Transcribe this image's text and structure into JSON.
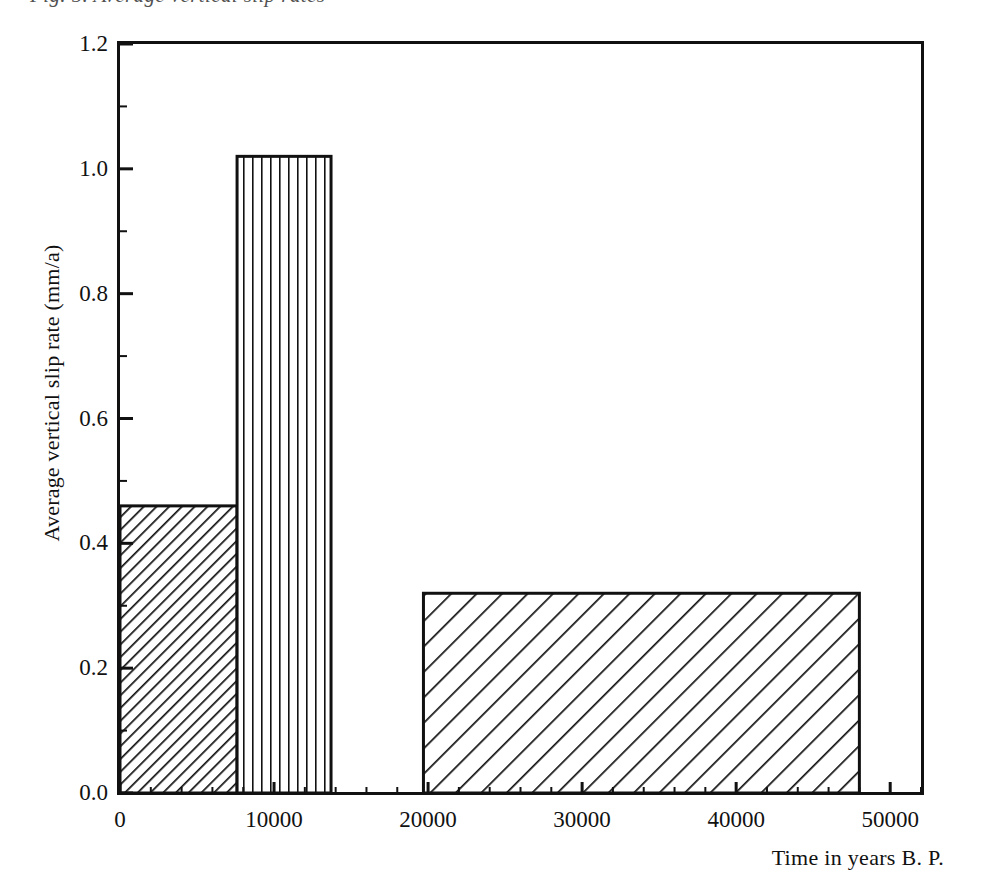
{
  "figure": {
    "background_color": "#ffffff",
    "ink_color": "#111111",
    "top_cropped_caption": "Fig. 5. Average vertical slip rates"
  },
  "chart_data": {
    "type": "bar",
    "title": "",
    "subtitle": "",
    "xlabel": "Time in years B. P.",
    "ylabel": "Average vertical slip rate (mm/a)",
    "xlim": [
      0,
      52000
    ],
    "ylim": [
      0.0,
      1.2
    ],
    "grid": false,
    "legend": null,
    "x_major_ticks": [
      0,
      10000,
      20000,
      30000,
      40000,
      50000
    ],
    "x_tick_labels": [
      "0",
      "10000",
      "20000",
      "30000",
      "40000",
      "50000"
    ],
    "x_minor_tick_step": 2000,
    "y_major_ticks": [
      0.0,
      0.2,
      0.4,
      0.6,
      0.8,
      1.0,
      1.2
    ],
    "y_tick_labels": [
      "0.0",
      "0.2",
      "0.4",
      "0.6",
      "0.8",
      "1.0",
      "1.2"
    ],
    "y_minor_tick_step": 0.1,
    "categories": [
      "0 - 7600",
      "7600 - 13700",
      "19700 - 48000"
    ],
    "values": [
      0.46,
      1.02,
      0.32
    ],
    "bars": [
      {
        "label": "0 - 7600",
        "x_start": 0,
        "x_end": 7600,
        "value": 0.46,
        "fill_pattern": "diagonal-hatch-dense",
        "hatch_angle_deg": 45,
        "hatch_spacing_px": 9
      },
      {
        "label": "7600 - 13700",
        "x_start": 7600,
        "x_end": 13700,
        "value": 1.02,
        "fill_pattern": "vertical-hatch",
        "hatch_angle_deg": 90,
        "hatch_spacing_px": 9
      },
      {
        "label": "19700 - 48000",
        "x_start": 19700,
        "x_end": 48000,
        "value": 0.32,
        "fill_pattern": "diagonal-hatch-wide",
        "hatch_angle_deg": 45,
        "hatch_spacing_px": 18
      }
    ]
  },
  "axes": {
    "spines": [
      "left",
      "top",
      "right",
      "bottom"
    ],
    "tick_direction": "out",
    "line_color": "#111111"
  }
}
